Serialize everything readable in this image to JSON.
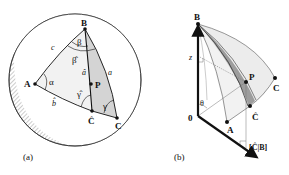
{
  "panel_a": {
    "caption": "(a)",
    "points": {
      "A": "A",
      "B": "B",
      "C": "C",
      "C_hat": "Ĉ",
      "P": "P"
    },
    "sides": {
      "a": "a",
      "a_hat": "â",
      "b_hat": "b̂",
      "c": "c"
    },
    "angles": {
      "alpha": "α",
      "beta": "β",
      "beta_hat": "β̂",
      "gamma": "γ",
      "gamma_hat": "γ̂"
    }
  },
  "panel_b": {
    "caption": "(b)",
    "points": {
      "B": "B",
      "P": "P",
      "C": "C",
      "C_hat": "Ĉ",
      "A": "A",
      "origin": "0"
    },
    "labels": {
      "z": "z",
      "theta": "θ",
      "projection": "[Ĉ|B]"
    }
  },
  "colors": {
    "ink": "#111111",
    "shade_light": "#e9e9e9",
    "shade_dark": "#cfcfcf",
    "band": "#9a9a9a"
  }
}
